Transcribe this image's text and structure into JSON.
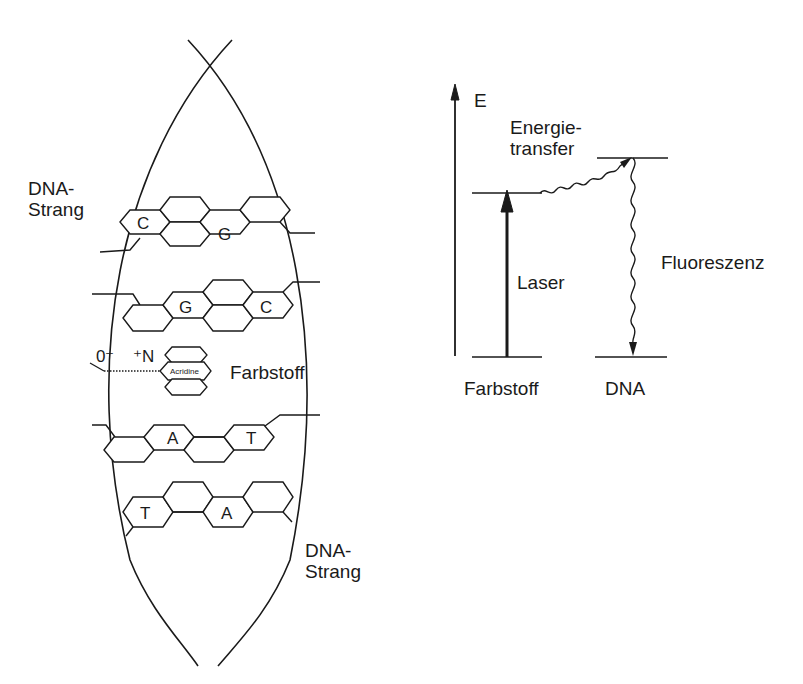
{
  "left_diagram": {
    "strand_label_top": [
      "DNA-",
      "Strang"
    ],
    "strand_label_bottom": [
      "DNA-",
      "Strang"
    ],
    "base_pairs": [
      {
        "left": "C",
        "right": "G"
      },
      {
        "left": "G",
        "right": "C"
      },
      {
        "left": "A",
        "right": "T"
      },
      {
        "left": "T",
        "right": "A"
      }
    ],
    "intercalator": {
      "anion": "0⁻",
      "cation": "⁺N",
      "ring_label": "Acridine",
      "label": "Farbstoff"
    }
  },
  "right_diagram": {
    "axis_label": "E",
    "transfer_label": [
      "Energie-",
      "transfer"
    ],
    "excitation_label": "Laser",
    "emission_label": "Fluoreszenz",
    "donor_label": "Farbstoff",
    "acceptor_label": "DNA"
  },
  "colors": {
    "ink": "#1a1a1a",
    "background": "#ffffff"
  }
}
